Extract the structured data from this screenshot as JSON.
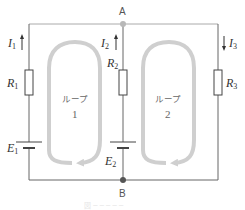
{
  "diagram": {
    "type": "circuit",
    "nodes": {
      "A": "A",
      "B": "B"
    },
    "currents": [
      {
        "id": "I1",
        "symbol": "I",
        "sub": "1",
        "direction": "up"
      },
      {
        "id": "I2",
        "symbol": "I",
        "sub": "2",
        "direction": "up"
      },
      {
        "id": "I3",
        "symbol": "I",
        "sub": "3",
        "direction": "down"
      }
    ],
    "resistors": [
      {
        "id": "R1",
        "symbol": "R",
        "sub": "1"
      },
      {
        "id": "R2",
        "symbol": "R",
        "sub": "2"
      },
      {
        "id": "R3",
        "symbol": "R",
        "sub": "3"
      }
    ],
    "sources": [
      {
        "id": "E1",
        "symbol": "E",
        "sub": "1"
      },
      {
        "id": "E2",
        "symbol": "E",
        "sub": "2"
      }
    ],
    "loops": [
      {
        "label": "ループ",
        "number": "1",
        "direction": "counterclockwise"
      },
      {
        "label": "ループ",
        "number": "2",
        "direction": "counterclockwise"
      }
    ],
    "caption": "図 ─ ─ ─ ─ ─",
    "colors": {
      "wire": "#666666",
      "node_top": "#b8b8b8",
      "node_bottom": "#555555",
      "loop_arrow": "#cfcfcf"
    }
  }
}
